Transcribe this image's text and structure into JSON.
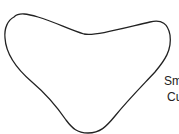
{
  "diagram": {
    "shape": {
      "type": "smooth-closed-curve",
      "stroke_color": "#222222",
      "fill_color": "#ffffff",
      "stroke_width": 1.3
    },
    "label": {
      "line1": "Sm",
      "line2": "Cu"
    }
  }
}
